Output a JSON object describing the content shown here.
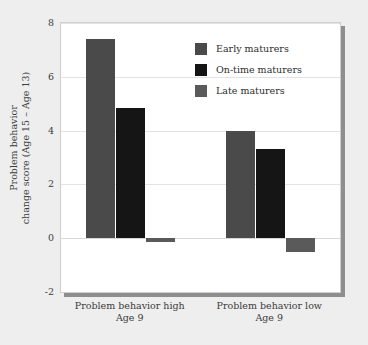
{
  "chart_data": {
    "type": "bar",
    "title": "",
    "xlabel": "",
    "ylabel_line1": "Problem behavior",
    "ylabel_line2": "change score (Age 15 – Age 13)",
    "categories": [
      "Problem behavior high",
      "Problem behavior low"
    ],
    "category_sublabels": [
      "Age 9",
      "Age 9"
    ],
    "series": [
      {
        "name": "Early maturers",
        "values": [
          7.4,
          4.0
        ],
        "color": "#4a4a4a"
      },
      {
        "name": "On-time maturers",
        "values": [
          4.85,
          3.3
        ],
        "color": "#151515"
      },
      {
        "name": "Late maturers",
        "values": [
          -0.15,
          -0.5
        ],
        "color": "#5a5a5a"
      }
    ],
    "ylim": [
      -2,
      8
    ],
    "yticks": [
      8,
      6,
      4,
      2,
      0,
      -2
    ],
    "ytick_labels": [
      "8",
      "6",
      "4",
      "2",
      "0",
      "-2"
    ],
    "grid": true,
    "legend_position": "upper center"
  },
  "legend": {
    "items": [
      {
        "label": "Early maturers"
      },
      {
        "label": "On-time maturers"
      },
      {
        "label": "Late maturers"
      }
    ]
  },
  "colors": {
    "page_background": "#eeeeee",
    "plot_background": "#ffffff",
    "gridline": "#e3e3e3",
    "shadow": "#8e8e8e",
    "text": "#3b3b3b"
  }
}
